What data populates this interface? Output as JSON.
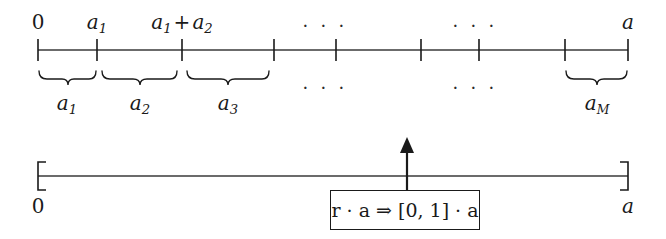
{
  "figure": {
    "background_color": "#ffffff",
    "ink_color": "#1a1a1a",
    "width": 666,
    "height": 239
  },
  "top_axis": {
    "name": "partitioned-number-line",
    "y": 50,
    "tick_positions": [
      38,
      97,
      182,
      274,
      336,
      421,
      479,
      565,
      628
    ],
    "tick_half_height": 11,
    "tick_labels": [
      {
        "text_zero": "0",
        "x": 38
      }
    ],
    "labels_above": [
      {
        "id": "zero",
        "display": "0",
        "x": 38,
        "italic": false
      },
      {
        "id": "a1",
        "display": "a",
        "subscript": "1",
        "x": 97,
        "italic": true
      },
      {
        "id": "a1plusa2",
        "display": "a",
        "subscript": "1",
        "plus": "+",
        "display2": "a",
        "subscript2": "2",
        "x": 182,
        "italic": true
      },
      {
        "id": "ellipsis-left",
        "display": "· · ·",
        "x": 325
      },
      {
        "id": "ellipsis-right",
        "display": "· · ·",
        "x": 475
      },
      {
        "id": "a-end",
        "display": "a",
        "x": 628,
        "italic": true
      }
    ]
  },
  "braces": [
    {
      "id": "brace-a1",
      "label_base": "a",
      "label_sub": "1",
      "x_start": 38,
      "x_end": 97,
      "label_x": 67
    },
    {
      "id": "brace-a2",
      "label_base": "a",
      "label_sub": "2",
      "x_start": 101,
      "x_end": 178,
      "label_x": 140
    },
    {
      "id": "brace-a3",
      "label_base": "a",
      "label_sub": "3",
      "x_start": 186,
      "x_end": 270,
      "label_x": 228
    },
    {
      "id": "brace-aM",
      "label_base": "a",
      "label_sub": "M",
      "x_start": 565,
      "x_end": 628,
      "label_x": 597
    }
  ],
  "brace_ellipses": [
    {
      "id": "brace-ellipsis-left",
      "display": "· · ·",
      "x": 325
    },
    {
      "id": "brace-ellipsis-right",
      "display": "· · ·",
      "x": 475
    }
  ],
  "bottom_axis": {
    "name": "full-interval-line",
    "y": 176,
    "x_start": 38,
    "x_end": 628,
    "bracket_half_height": 14,
    "left_label": "0",
    "right_label": "a",
    "left_label_x": 38,
    "right_label_x": 628,
    "label_y": 196
  },
  "pointer": {
    "name": "random-draw-arrow",
    "x": 407,
    "tip_y": 139,
    "base_y": 190
  },
  "formula_box": {
    "name": "scaling-formula",
    "text": "r · a ⇒ [0, 1] · a",
    "x": 330,
    "y": 190,
    "width": 148,
    "height": 38,
    "border_color": "#1a1a1a"
  }
}
